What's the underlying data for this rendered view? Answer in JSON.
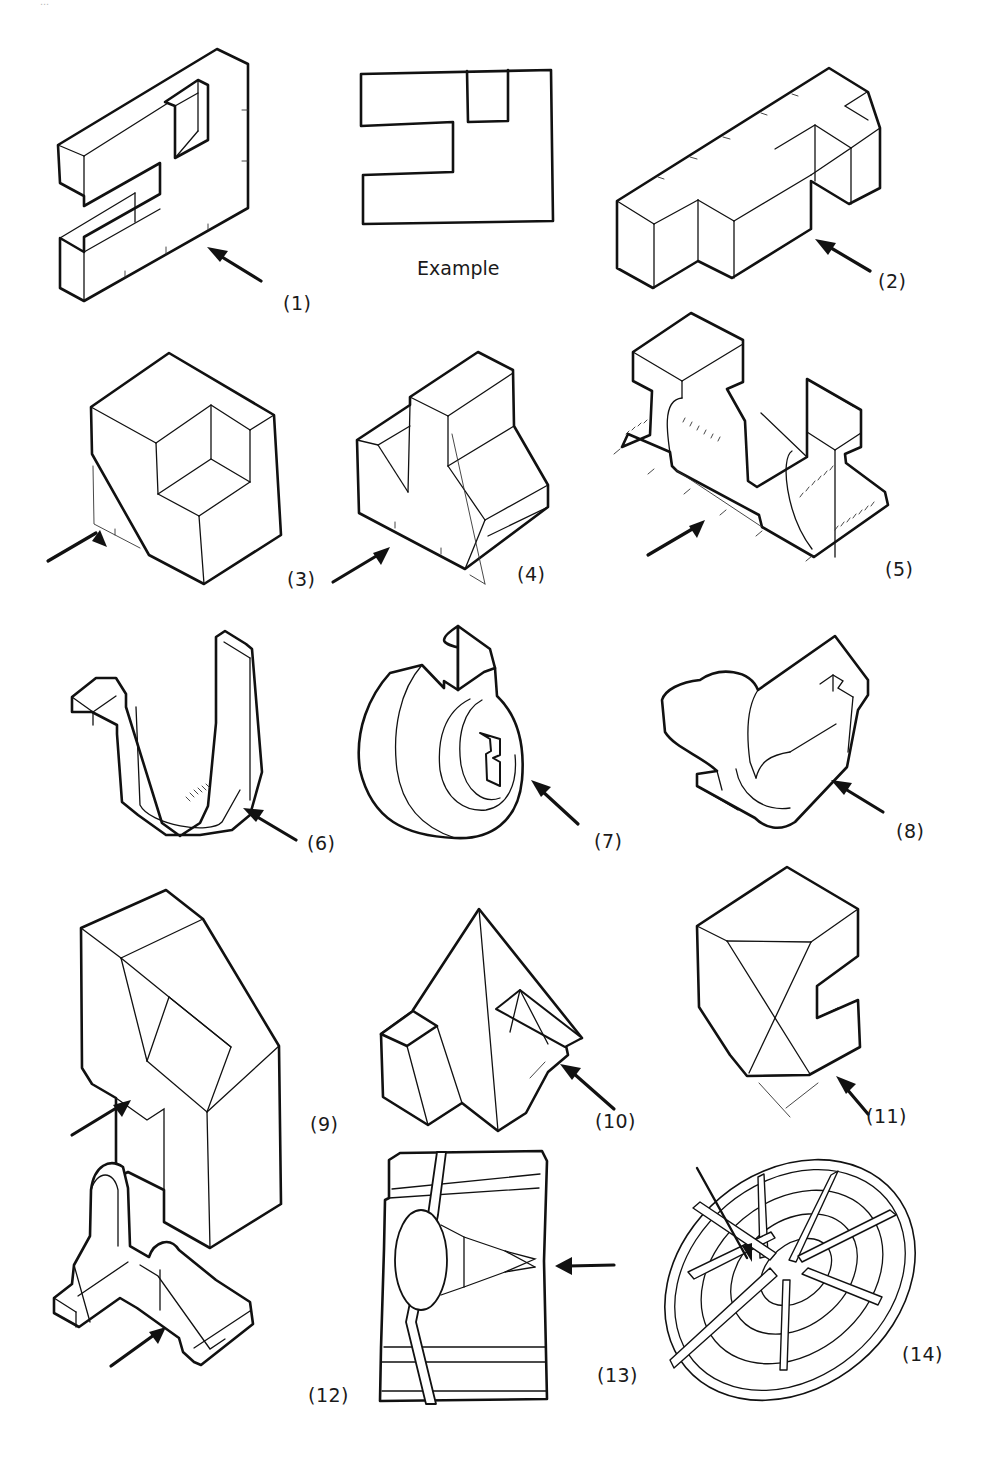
{
  "page": {
    "top_fragment_text": "...",
    "example": {
      "caption": "Example"
    },
    "figures": [
      {
        "id": 1,
        "label": "(1)",
        "shape": "slab-with-e-notch",
        "arrow": "lower-right pointing up-left"
      },
      {
        "id": 2,
        "label": "(2)",
        "shape": "stepped-block-with-t-arm",
        "arrow": "lower-right pointing up-left"
      },
      {
        "id": 3,
        "label": "(3)",
        "shape": "cube-with-corner-cutout",
        "arrow": "lower-left pointing up-right"
      },
      {
        "id": 4,
        "label": "(4)",
        "shape": "block-with-slot-and-bevel",
        "arrow": "lower-left pointing up-right"
      },
      {
        "id": 5,
        "label": "(5)",
        "shape": "double-i-beam-bracket",
        "arrow": "lower-left pointing up-right"
      },
      {
        "id": 6,
        "label": "(6)",
        "shape": "bent-strip-hook",
        "arrow": "lower-right pointing up-left"
      },
      {
        "id": 7,
        "label": "(7)",
        "shape": "notched-disc-with-keyway",
        "arrow": "lower-right pointing up-left"
      },
      {
        "id": 8,
        "label": "(8)",
        "shape": "half-cylinder-clip",
        "arrow": "lower-right pointing up-left"
      },
      {
        "id": 9,
        "label": "(9)",
        "shape": "block-with-pyramidal-recess",
        "arrow": "lower-left pointing up-right"
      },
      {
        "id": 10,
        "label": "(10)",
        "shape": "pyramid-with-block",
        "arrow": "lower-right pointing up-left"
      },
      {
        "id": 11,
        "label": "(11)",
        "shape": "faceted-c-block",
        "arrow": "lower-right pointing up-left"
      },
      {
        "id": 12,
        "label": "(12)",
        "shape": "ribbed-angle-bracket",
        "arrow": "lower-left pointing up-right"
      },
      {
        "id": 13,
        "label": "(13)",
        "shape": "plate-with-boss-and-rib",
        "arrow": "right pointing left"
      },
      {
        "id": 14,
        "label": "(14)",
        "shape": "spoked-wheel-grate",
        "arrow": "top-left pointing down-right"
      }
    ]
  }
}
